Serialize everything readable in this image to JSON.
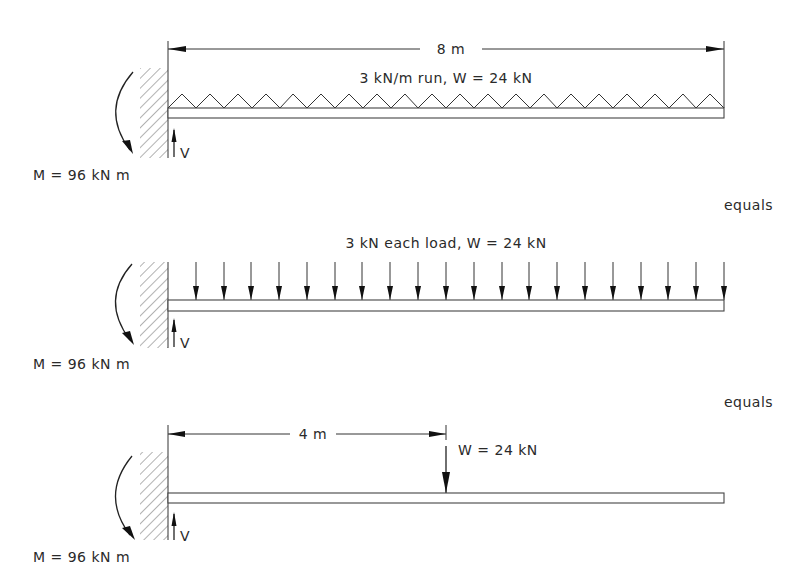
{
  "figure": {
    "panels": [
      {
        "id": "uniform-load",
        "dimension_label": "8 m",
        "load_label": "3 kN/m run, W = 24 kN",
        "moment_label": "M = 96 kN m",
        "shear_label": "V",
        "load_type": "distributed",
        "triangles": 20,
        "separator_label": "equals"
      },
      {
        "id": "point-loads",
        "load_label": "3 kN each load, W = 24 kN",
        "moment_label": "M = 96 kN m",
        "shear_label": "V",
        "load_type": "discrete",
        "arrow_count": 20,
        "separator_label": "equals"
      },
      {
        "id": "resultant-load",
        "dimension_label": "4 m",
        "load_label": "W = 24 kN",
        "moment_label": "M = 96 kN m",
        "shear_label": "V",
        "load_type": "resultant"
      }
    ]
  }
}
